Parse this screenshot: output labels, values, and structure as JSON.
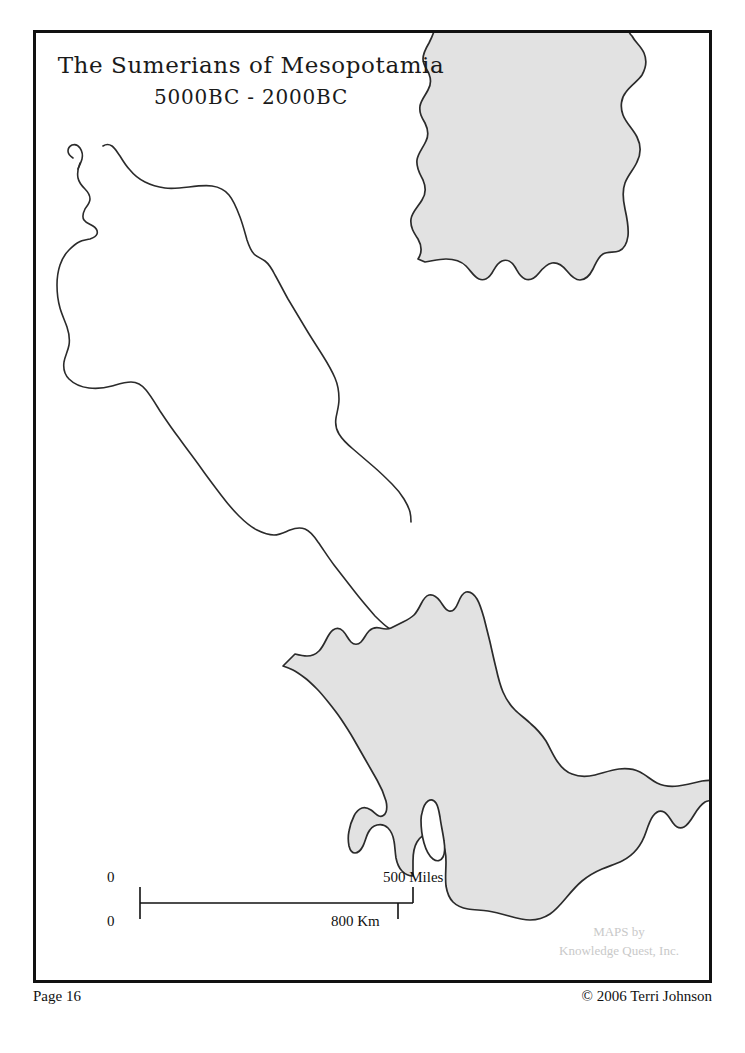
{
  "page": {
    "background_color": "#ffffff",
    "width": 745,
    "height": 1053
  },
  "map": {
    "title": "The Sumerians of Mesopotamia",
    "subtitle": "5000BC - 2000BC",
    "border_color": "#111111",
    "land_fill_color": "#e2e2e2",
    "coastline_color": "#2b2b2b",
    "water_fill_color": "#ffffff"
  },
  "scale": {
    "zero_top_label": "0",
    "zero_bottom_label": "0",
    "miles_label": "500 Miles",
    "km_label": "800 Km",
    "miles_value": 500,
    "km_value": 800
  },
  "watermark": {
    "line1": "MAPS by",
    "line2": "Knowledge Quest, Inc.",
    "color": "#c9c9c9"
  },
  "footer": {
    "page_label": "Page 16",
    "copyright": "© 2006 Terri Johnson"
  }
}
